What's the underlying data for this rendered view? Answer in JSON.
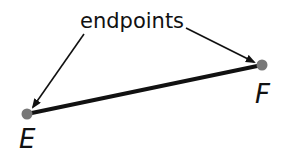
{
  "diagram": {
    "callout_label": "endpoints",
    "segment": {
      "start": {
        "label": "E",
        "x": 27,
        "y": 114
      },
      "end": {
        "label": "F",
        "x": 262,
        "y": 65
      }
    },
    "colors": {
      "segment": "#111111",
      "point": "#777777",
      "arrow": "#111111",
      "text": "#111111"
    }
  }
}
